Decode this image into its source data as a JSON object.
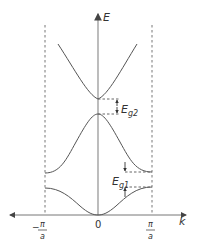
{
  "diagram": {
    "axes": {
      "y_label": "E",
      "x_label": "k",
      "x_ticks": [
        {
          "num": "π",
          "den": "a",
          "sign": "−"
        },
        {
          "value": "0"
        },
        {
          "num": "π",
          "den": "a",
          "sign": ""
        }
      ]
    },
    "gaps": [
      {
        "label_main": "E",
        "label_sub": "g2",
        "location": "k = 0"
      },
      {
        "label_main": "E",
        "label_sub": "g1",
        "location": "k = π/a"
      }
    ],
    "bands": [
      "lowest band",
      "second band",
      "third band"
    ],
    "zone_boundaries": [
      "-π/a",
      "π/a"
    ],
    "colors": {
      "curve": "#555555",
      "axis": "#888888",
      "dashed": "#666666",
      "text": "#333333"
    }
  }
}
